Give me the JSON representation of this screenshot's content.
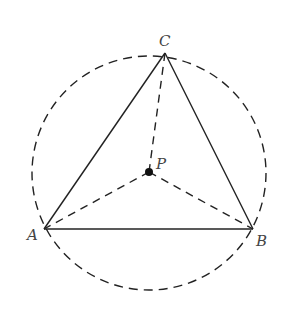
{
  "diagram": {
    "type": "geometry",
    "colors": {
      "stroke": "#222222",
      "label": "#444444",
      "background": "#ffffff"
    },
    "circle": {
      "cx": 149,
      "cy": 173,
      "r": 117,
      "style": "dashed"
    },
    "points": {
      "A": {
        "label": "A",
        "x": 44,
        "y": 229
      },
      "B": {
        "label": "B",
        "x": 253,
        "y": 229
      },
      "C": {
        "label": "C",
        "x": 165,
        "y": 53
      },
      "P": {
        "label": "P",
        "x": 149,
        "y": 172
      }
    },
    "solid_segments": [
      [
        "A",
        "B"
      ],
      [
        "B",
        "C"
      ],
      [
        "C",
        "A"
      ]
    ],
    "dashed_segments": [
      [
        "P",
        "A"
      ],
      [
        "P",
        "B"
      ],
      [
        "P",
        "C"
      ]
    ]
  }
}
